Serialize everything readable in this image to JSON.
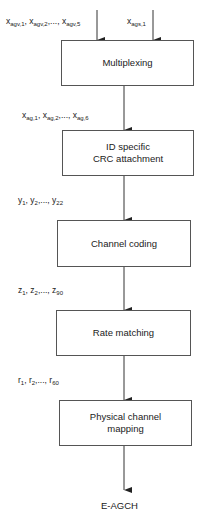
{
  "diagram": {
    "inputs": {
      "agv": {
        "base": "x",
        "items": [
          {
            "sub": "agv,1"
          },
          {
            "sub": "agv,2"
          },
          {
            "sub": "agv,5"
          }
        ],
        "text": "x_agv,1, x_agv,2,..., x_agv,5"
      },
      "ags": {
        "base": "x",
        "sub": "ags,1",
        "text": "x_ags,1"
      }
    },
    "blocks": [
      {
        "id": "multiplexing",
        "label": "Multiplexing"
      },
      {
        "id": "crc",
        "label_line1": "ID specific",
        "label_line2": "CRC attachment"
      },
      {
        "id": "channel-coding",
        "label": "Channel coding"
      },
      {
        "id": "rate-matching",
        "label": "Rate matching"
      },
      {
        "id": "physical-channel-mapping",
        "label_line1": "Physical channel",
        "label_line2": "mapping"
      }
    ],
    "signals": [
      {
        "base": "x",
        "sub1": "ag,1",
        "sub2": "ag,2",
        "subN": "ag,6",
        "text": "x_ag,1, x_ag,2,..., x_ag,6"
      },
      {
        "base": "y",
        "sub1": "1",
        "sub2": "2",
        "subN": "22",
        "text": "y_1, y_2,..., y_22"
      },
      {
        "base": "z",
        "sub1": "1",
        "sub2": "2",
        "subN": "90",
        "text": "z_1, z_2,..., z_90"
      },
      {
        "base": "r",
        "sub1": "1",
        "sub2": "2",
        "subN": "60",
        "text": "r_1, r_2,..., r_60"
      }
    ],
    "output": "E-AGCH",
    "colors": {
      "line": "#333333",
      "box_border": "#555555",
      "text": "#1a1a1a"
    }
  }
}
